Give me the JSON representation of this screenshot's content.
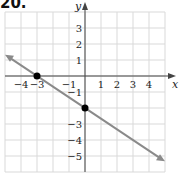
{
  "problem_number": "20.",
  "axes": {
    "x_label": "x",
    "y_label": "y"
  },
  "x_ticks": [
    {
      "v": -4,
      "label": "−4"
    },
    {
      "v": -3,
      "label": "−3"
    },
    {
      "v": -1,
      "label": "−1"
    },
    {
      "v": 1,
      "label": "1"
    },
    {
      "v": 2,
      "label": "2"
    },
    {
      "v": 3,
      "label": "3"
    },
    {
      "v": 4,
      "label": "4"
    }
  ],
  "y_ticks": [
    {
      "v": 3,
      "label": "3"
    },
    {
      "v": 2,
      "label": "2"
    },
    {
      "v": 1,
      "label": "1"
    },
    {
      "v": -1,
      "label": "−1"
    },
    {
      "v": -3,
      "label": "−3"
    },
    {
      "v": -4,
      "label": "−4"
    },
    {
      "v": -5,
      "label": "−5"
    }
  ],
  "line": {
    "slope": -0.6667,
    "intercept": -2,
    "color": "#888888"
  },
  "points": [
    {
      "x": -3,
      "y": 0
    },
    {
      "x": 0,
      "y": -2
    }
  ],
  "colors": {
    "grid": "#d9d9d9",
    "axis": "#444444",
    "line": "#8a8a8a",
    "point": "#000000"
  }
}
